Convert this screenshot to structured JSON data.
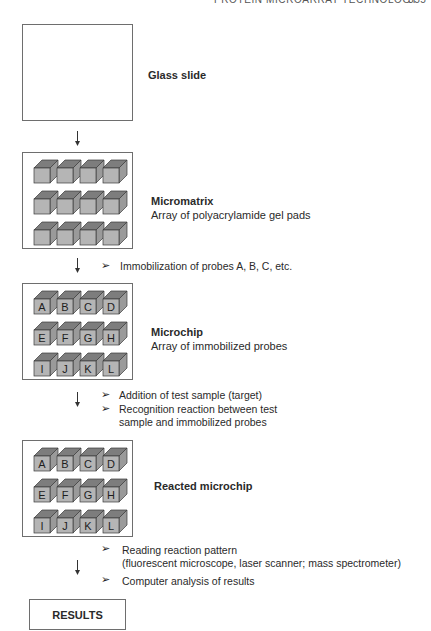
{
  "header": {
    "running_title": "PROTEIN MICROARRAY TECHNOLOGY",
    "page_number": "355"
  },
  "steps": [
    {
      "id": "glass-slide",
      "title": "Glass slide",
      "description": ""
    },
    {
      "id": "micromatrix",
      "title": "Micromatrix",
      "description": "Array of polyacrylamide gel pads"
    },
    {
      "id": "microchip",
      "title": "Microchip",
      "description": "Array of immobilized probes",
      "pad_labels": [
        "A",
        "B",
        "C",
        "D",
        "E",
        "F",
        "G",
        "H",
        "I",
        "J",
        "K",
        "L"
      ]
    },
    {
      "id": "reacted-microchip",
      "title": "Reacted microchip",
      "description": "",
      "pad_labels": [
        "A",
        "B",
        "C",
        "D",
        "E",
        "F",
        "G",
        "H",
        "I",
        "J",
        "K",
        "L"
      ]
    }
  ],
  "transitions": [
    {
      "bullets": [
        "Immobilization of probes A, B, C, etc."
      ]
    },
    {
      "bullets": [
        "Addition of test sample (target)",
        "Recognition reaction between test",
        "sample and immobilized probes"
      ]
    },
    {
      "bullets": [
        "Reading reaction pattern",
        "(fluorescent microscope, laser scanner; mass spectrometer)",
        "Computer analysis of results"
      ]
    }
  ],
  "result": {
    "label": "RESULTS"
  },
  "colors": {
    "cube_front": "#b5b5b5",
    "cube_top": "#7d7d7d",
    "cube_side": "#9a9a9a",
    "cube_edge": "#3a3a3a",
    "box_border": "#6e6e6e"
  }
}
